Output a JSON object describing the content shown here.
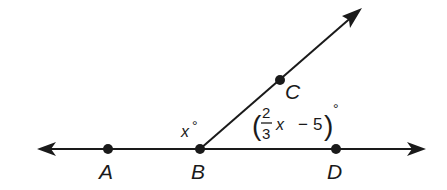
{
  "diagram": {
    "type": "geometry-angles",
    "colors": {
      "stroke": "#1a1a1a",
      "background": "#ffffff"
    },
    "line": {
      "name": "line-AD",
      "from": [
        37,
        149
      ],
      "to": [
        426,
        149
      ],
      "arrows": "both"
    },
    "ray": {
      "name": "ray-BC",
      "from": [
        200,
        149
      ],
      "to": [
        362,
        8
      ],
      "arrows": "end"
    },
    "points": [
      {
        "id": "A",
        "label": "A",
        "x": 108,
        "y": 149,
        "label_x": 99,
        "label_y": 178
      },
      {
        "id": "B",
        "label": "B",
        "x": 200,
        "y": 149,
        "label_x": 191,
        "label_y": 178
      },
      {
        "id": "C",
        "label": "C",
        "x": 280,
        "y": 80,
        "label_x": 285,
        "label_y": 98
      },
      {
        "id": "D",
        "label": "D",
        "x": 336,
        "y": 149,
        "label_x": 327,
        "label_y": 178
      }
    ],
    "angles": {
      "ABC": {
        "variable": "x",
        "degree": "°"
      },
      "CBD": {
        "open_paren": "(",
        "numerator": "2",
        "denominator": "3",
        "variable": "x",
        "operator": "−",
        "constant": "5",
        "close_paren": ")",
        "degree": "°"
      }
    }
  }
}
